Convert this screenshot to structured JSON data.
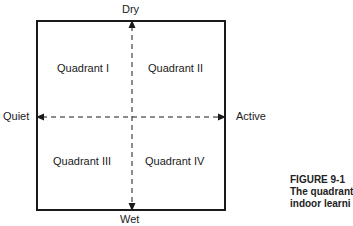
{
  "axes": {
    "top": "Dry",
    "bottom": "Wet",
    "left": "Quiet",
    "right": "Active"
  },
  "quadrants": [
    "Quadrant I",
    "Quadrant II",
    "Quadrant III",
    "Quadrant IV"
  ],
  "caption": {
    "figure": "FIGURE 9-1",
    "line1": "The quadrant",
    "line2": "indoor learni"
  }
}
